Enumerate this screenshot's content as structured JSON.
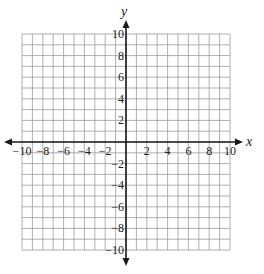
{
  "diagram": {
    "type": "coordinate-plane",
    "x_axis": {
      "label": "x",
      "min": -10,
      "max": 10,
      "grid_step": 1,
      "label_step": 2,
      "tick_labels": [
        "−10",
        "−8",
        "−6",
        "−4",
        "−2",
        "2",
        "4",
        "6",
        "8",
        "10"
      ]
    },
    "y_axis": {
      "label": "y",
      "min": -10,
      "max": 10,
      "grid_step": 1,
      "label_step": 2,
      "tick_labels": [
        "10",
        "8",
        "6",
        "4",
        "2",
        "−2",
        "−4",
        "−6",
        "−8",
        "−10"
      ]
    },
    "grid": true,
    "colors": {
      "grid": "#9a9a9a",
      "axis": "#1a1a1a",
      "label": "#222222"
    }
  },
  "chart_data": {
    "type": "coordinate-grid",
    "title": "",
    "xlabel": "x",
    "ylabel": "y",
    "xlim": [
      -10,
      10
    ],
    "ylim": [
      -10,
      10
    ],
    "x_ticks": [
      -10,
      -8,
      -6,
      -4,
      -2,
      2,
      4,
      6,
      8,
      10
    ],
    "y_ticks": [
      -10,
      -8,
      -6,
      -4,
      -2,
      2,
      4,
      6,
      8,
      10
    ],
    "grid": true,
    "series": []
  }
}
